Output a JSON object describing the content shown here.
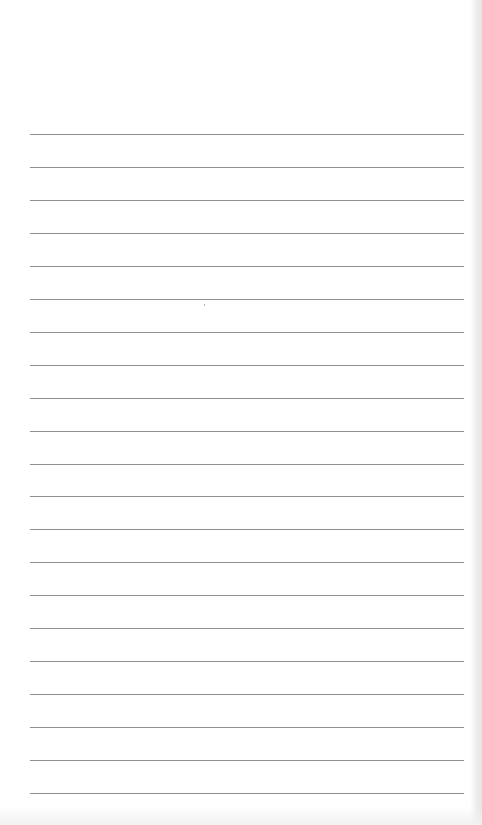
{
  "page": {
    "type": "lined-paper",
    "background_color": "#ffffff",
    "line_color": "#8f8f8f",
    "line_count": 21,
    "line_left": 30,
    "line_width": 434,
    "first_line_y": 134,
    "line_spacing": 32.95
  },
  "text_content": []
}
